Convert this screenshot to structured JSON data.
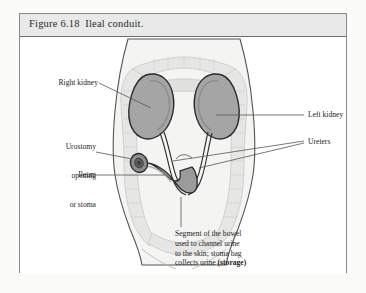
{
  "figure": {
    "title_number": "Figure 6.18",
    "title_text": "Ileal conduit.",
    "title_full": "Figure 6.18  Ileal conduit."
  },
  "labels": {
    "right_kidney": "Right kidney",
    "urostomy_line1": "Urostomy",
    "urostomy_line2": "opening",
    "urostomy_line3": "or stoma",
    "ileum": "Ileum",
    "left_kidney": "Left kidney",
    "ureters": "Ureters"
  },
  "caption": {
    "line1": "Segment of the bowel",
    "line2": "used to channel urine",
    "line3": "to the skin; stoma bag",
    "line4": "collects urine ",
    "emphasis": "(storage)"
  },
  "anatomy": {
    "torso_name": "torso-silhouette",
    "colon_name": "large-intestine",
    "left_kidney_name": "left-kidney",
    "right_kidney_name": "right-kidney",
    "ureter_left_name": "left-ureter",
    "ureter_right_name": "right-ureter",
    "conduit_name": "ileal-conduit",
    "stoma_name": "stoma-opening"
  },
  "colors": {
    "page_background": "#fbfbf9",
    "box_background": "#ffffff",
    "box_border": "#8a8a8a",
    "title_bar_fill": "#e9e9e9",
    "title_bar_rule": "#6e6e6e",
    "text": "#1d1d1d",
    "organ_fill": "#a5a5a5",
    "organ_outline": "#2b2b2b",
    "colon_fill": "#e3e3e3",
    "colon_outline": "#c3c3c3",
    "torso_outline": "#555555",
    "body_fill": "#f4f4f2",
    "leader_line": "#555555",
    "stoma_dark": "#6d6d6d"
  }
}
